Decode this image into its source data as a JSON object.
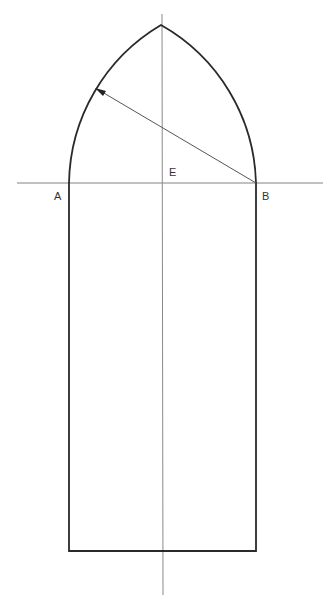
{
  "diagram": {
    "labels": [
      {
        "id": "A",
        "text": "A",
        "x": 54,
        "y": 190
      },
      {
        "id": "E",
        "text": "E",
        "x": 169,
        "y": 166
      },
      {
        "id": "B",
        "text": "B",
        "x": 262,
        "y": 190
      }
    ],
    "colors": {
      "outline": "#2a2a2a",
      "guide": "#8a7f80",
      "radius": "#555555"
    },
    "geometry": {
      "springing_line_y": 183,
      "left_x": 69,
      "right_x": 256,
      "center_x": 162,
      "apex_y": 25,
      "base_y": 551,
      "radius_arrow": {
        "from": [
          256,
          183
        ],
        "to": [
          95,
          88
        ]
      }
    }
  }
}
